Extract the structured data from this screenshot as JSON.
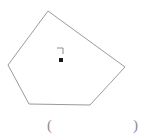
{
  "figure": {
    "type": "geometry-diagram",
    "shape_name": "irregular-pentagon",
    "stroke_color": "#9a9a9a",
    "fill_color": "none",
    "stroke_width": 1,
    "background_color": "#ffffff",
    "polygon_points": "48,11 125,67 90,105 29,104 8,65",
    "vertices": [
      {
        "label": "top",
        "x": 48,
        "y": 11
      },
      {
        "label": "right",
        "x": 125,
        "y": 67
      },
      {
        "label": "bottom-right",
        "x": 90,
        "y": 105
      },
      {
        "label": "bottom-left",
        "x": 29,
        "y": 104
      },
      {
        "label": "left",
        "x": 8,
        "y": 65
      }
    ],
    "center_point": {
      "x": 61,
      "y": 60,
      "size": 4,
      "color": "#1a1a1a"
    },
    "right_angle_mark": {
      "x": 57,
      "y": 48,
      "width": 6,
      "height": 6,
      "color": "#8c8c8c",
      "path": "M 57 48 L 63 48 L 63 54"
    }
  },
  "labels": {
    "paren_left": "(",
    "paren_right": ")"
  }
}
